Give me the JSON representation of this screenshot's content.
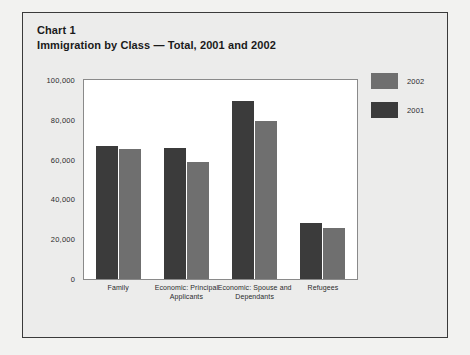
{
  "header": {
    "chart_label": "Chart 1",
    "chart_title": "Immigration by Class — Total, 2001 and 2002"
  },
  "legend": {
    "position": "right",
    "entries": [
      {
        "label": "2002",
        "color": "#6f6f6f"
      },
      {
        "label": "2001",
        "color": "#3b3b3b"
      }
    ]
  },
  "axis": {
    "y_ticks": [
      "100,000",
      "80,000",
      "60,000",
      "40,000",
      "20,000",
      "0"
    ]
  },
  "chart_data": {
    "type": "bar",
    "title": "Immigration by Class — Total, 2001 and 2002",
    "subtitle": "Chart 1",
    "xlabel": "",
    "ylabel": "",
    "ylim": [
      0,
      100000
    ],
    "ytick_values": [
      0,
      20000,
      40000,
      60000,
      80000,
      100000
    ],
    "ytick_labels": [
      "0",
      "20,000",
      "40,000",
      "60,000",
      "80,000",
      "100,000"
    ],
    "grid": false,
    "legend_position": "right",
    "categories": [
      "Family",
      "Economic: Principal Applicants",
      "Economic: Spouse and Dependants",
      "Refugees"
    ],
    "series": [
      {
        "name": "2001",
        "color": "#3b3b3b",
        "values": [
          66600,
          66000,
          89500,
          27900
        ]
      },
      {
        "name": "2002",
        "color": "#6f6f6f",
        "values": [
          65300,
          58900,
          79500,
          25500
        ]
      }
    ]
  }
}
